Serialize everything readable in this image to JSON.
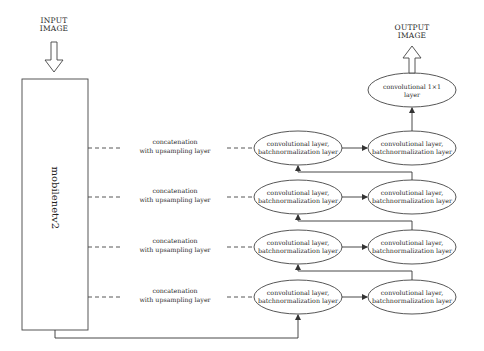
{
  "diagram": {
    "input": {
      "line1": "INPUT",
      "line2": "IMAGE"
    },
    "output": {
      "line1": "OUTPUT",
      "line2": "IMAGE"
    },
    "backbone": {
      "label": "mobilenetv2"
    },
    "final_layer": {
      "line1": "convolutional 1×1",
      "line2": "layer"
    },
    "rows": [
      {
        "concat": {
          "line1": "concatenation",
          "line2": "with upsampling layer"
        },
        "left_block": {
          "line1": "convolutional layer,",
          "line2": "batchnormalization layer"
        },
        "right_block": {
          "line1": "convolutional layer,",
          "line2": "batchnormalization layer"
        }
      },
      {
        "concat": {
          "line1": "concatenation",
          "line2": "with upsampling layer"
        },
        "left_block": {
          "line1": "convolutional layer,",
          "line2": "batchnormalization layer"
        },
        "right_block": {
          "line1": "convolutional layer,",
          "line2": "batchnormalization layer"
        }
      },
      {
        "concat": {
          "line1": "concatenation",
          "line2": "with upsampling layer"
        },
        "left_block": {
          "line1": "convolutional layer,",
          "line2": "batchnormalization layer"
        },
        "right_block": {
          "line1": "convolutional layer,",
          "line2": "batchnormalization layer"
        }
      },
      {
        "concat": {
          "line1": "concatenation",
          "line2": "with upsampling layer"
        },
        "left_block": {
          "line1": "convolutional layer,",
          "line2": "batchnormalization layer"
        },
        "right_block": {
          "line1": "convolutional layer,",
          "line2": "batchnormalization layer"
        }
      }
    ],
    "colors": {
      "stroke": "#444444",
      "text": "#2a2a2a",
      "background": "#ffffff"
    }
  }
}
